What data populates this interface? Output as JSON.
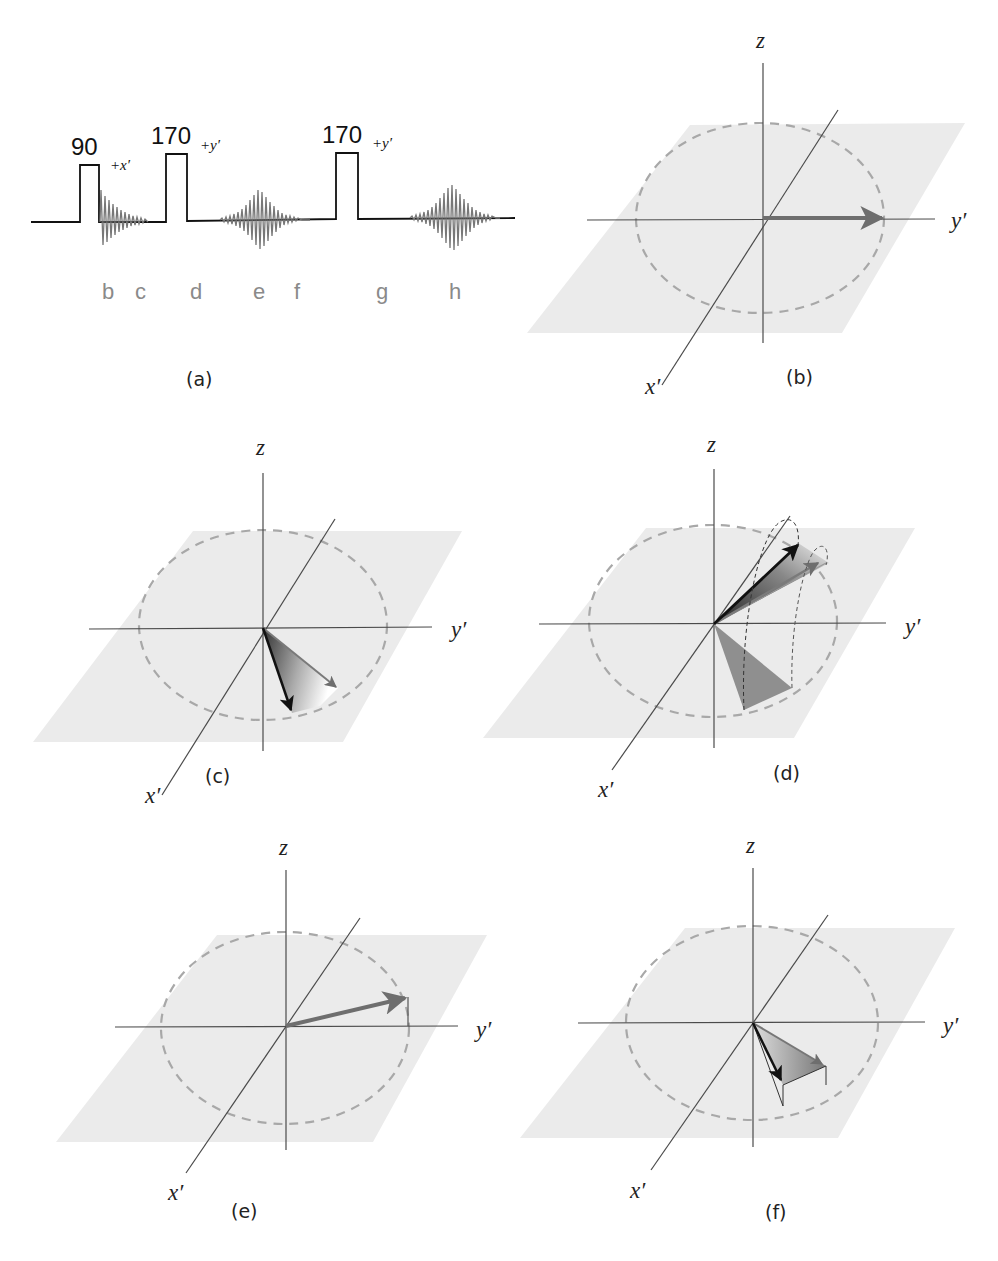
{
  "pulse_sequence": {
    "panel_label": "(a)",
    "pulses": [
      {
        "angle": "90",
        "phase": "+x′"
      },
      {
        "angle": "170",
        "phase": "+y′"
      },
      {
        "angle": "170",
        "phase": "+y′"
      }
    ],
    "segments": [
      "b",
      "c",
      "d",
      "e",
      "f",
      "g",
      "h"
    ]
  },
  "panels": [
    {
      "id": "b",
      "label": "(b)",
      "axes": {
        "z": "z",
        "x": "x′",
        "y": "y′"
      },
      "description": "Magnetization vector along +y′"
    },
    {
      "id": "c",
      "label": "(c)",
      "axes": {
        "z": "z",
        "x": "x′",
        "y": "y′"
      },
      "description": "Spins dephasing in transverse plane"
    },
    {
      "id": "d",
      "label": "(d)",
      "axes": {
        "z": "z",
        "x": "x′",
        "y": "y′"
      },
      "description": "170° refocusing pulse flips dephased fan"
    },
    {
      "id": "e",
      "label": "(e)",
      "axes": {
        "z": "z",
        "x": "x′",
        "y": "y′"
      },
      "description": "Echo formed, vector near +y′ slightly above plane"
    },
    {
      "id": "f",
      "label": "(f)",
      "axes": {
        "z": "z",
        "x": "x′",
        "y": "y′"
      },
      "description": "Spins dephasing again below plane"
    }
  ],
  "colors": {
    "plane": "#ebebeb",
    "circle": "#a8a8a8",
    "axis": "#4a4a4a",
    "vector_gray": "#6e6e6e",
    "vector_black": "#111111",
    "segment_label": "#8a8a8a"
  }
}
